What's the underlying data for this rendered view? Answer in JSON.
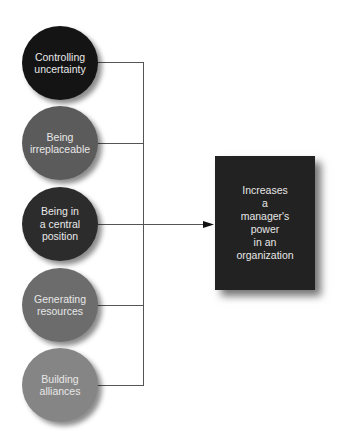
{
  "diagram": {
    "sources": [
      {
        "label": "Controlling\nuncertainty",
        "color": "#141414",
        "cy": 63
      },
      {
        "label": "Being\nirreplaceable",
        "color": "#5b5b5b",
        "cy": 143
      },
      {
        "label": "Being in\na central\nposition",
        "color": "#2c2c2c",
        "cy": 224
      },
      {
        "label": "Generating\nresources",
        "color": "#6c6c6c",
        "cy": 305
      },
      {
        "label": "Building\nalliances",
        "color": "#858585",
        "cy": 385
      }
    ],
    "target": {
      "label": "Increases\na\nmanager's\npower\nin an\norganization",
      "color": "#222222"
    },
    "line_color": "#555555"
  }
}
